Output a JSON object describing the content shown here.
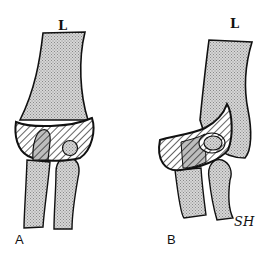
{
  "figure": {
    "panels": [
      {
        "id": "A",
        "panel_label": "A",
        "side_label": "L"
      },
      {
        "id": "B",
        "panel_label": "B",
        "side_label": "L"
      }
    ],
    "signature": "SH"
  },
  "colors": {
    "bone_fill": "#c8c8c8",
    "outline": "#111111",
    "background": "#ffffff"
  }
}
